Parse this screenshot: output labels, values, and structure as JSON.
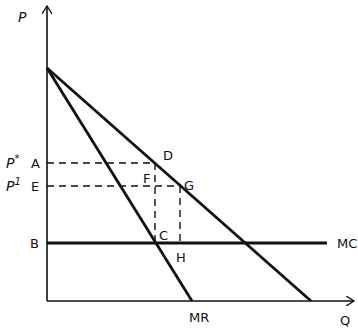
{
  "diagram": {
    "axes": {
      "y_label": "P",
      "x_label": "Q"
    },
    "price_labels": {
      "p_star": "P*",
      "p_star_base": "P",
      "p_star_sup": "*",
      "p_one_base": "P",
      "p_one_sup": "1"
    },
    "points": {
      "A": "A",
      "E": "E",
      "B": "B",
      "D": "D",
      "F": "F",
      "G": "G",
      "C": "C",
      "H": "H"
    },
    "curves": {
      "mc": "MC",
      "mr": "MR",
      "demand": ""
    },
    "colors": {
      "ink": "#111111",
      "background": "#ffffff"
    }
  }
}
